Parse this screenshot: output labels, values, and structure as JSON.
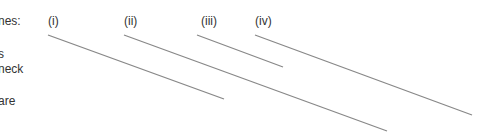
{
  "left_text": {
    "line1": "nes:",
    "line2": "s",
    "line3": "neck",
    "line4": "are"
  },
  "labels": [
    "(i)",
    "(ii)",
    "(iii)",
    "(iv)"
  ],
  "lines": [
    {
      "label": "(i)",
      "x1": 48,
      "y1": 35,
      "x2": 224,
      "y2": 99
    },
    {
      "label": "(ii)",
      "x1": 124,
      "y1": 35,
      "x2": 387,
      "y2": 131
    },
    {
      "label": "(iii)",
      "x1": 197,
      "y1": 35,
      "x2": 283,
      "y2": 67
    },
    {
      "label": "(iv)",
      "x1": 255,
      "y1": 35,
      "x2": 472,
      "y2": 115
    }
  ],
  "line_color": "#888888"
}
